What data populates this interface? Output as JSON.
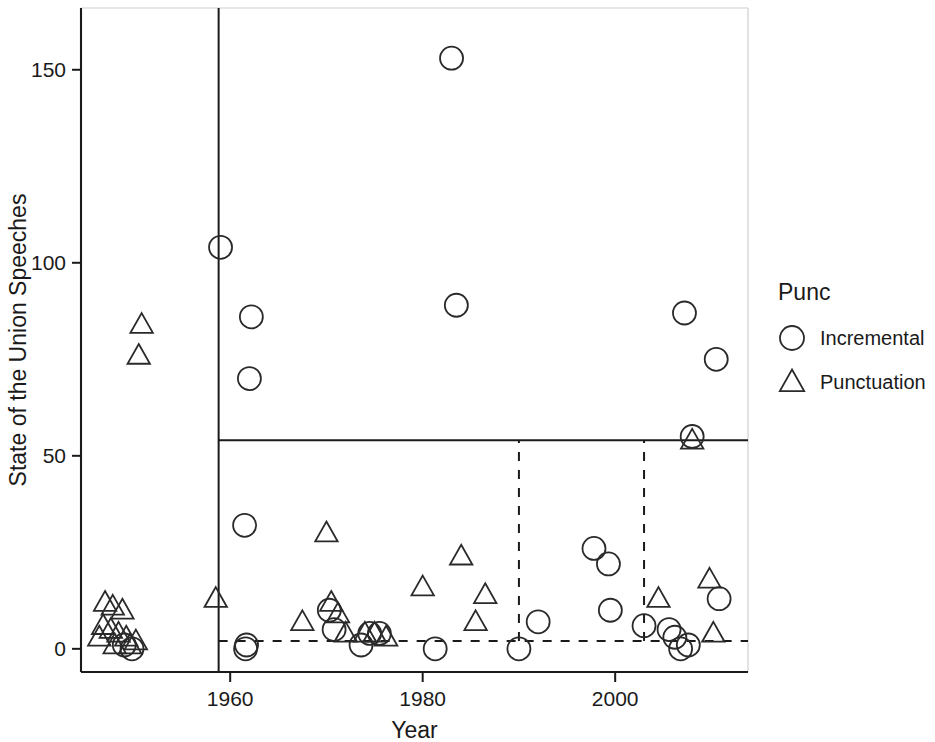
{
  "chart_data": {
    "type": "scatter",
    "title": "",
    "xlabel": "Year",
    "ylabel": "State of the Union Speeches",
    "xlim": [
      1944.5,
      2013.8
    ],
    "ylim": [
      -6,
      166
    ],
    "grid": false,
    "xticks": [
      1960,
      1980,
      2000
    ],
    "xticklabels": [
      "1960",
      "1980",
      "2000"
    ],
    "yticks": [
      0,
      50,
      100,
      150
    ],
    "yticklabels": [
      "0",
      "50",
      "100",
      "150"
    ],
    "legend": {
      "title": "Punc",
      "position": "right",
      "entries": [
        {
          "label": "Incremental",
          "marker": "circle"
        },
        {
          "label": "Punctuation",
          "marker": "triangle"
        }
      ]
    },
    "reference_lines": [
      {
        "name": "vertical-solid-1959",
        "orientation": "vertical",
        "value": 1958.8,
        "style": "solid"
      },
      {
        "name": "horizontal-solid-54",
        "orientation": "horizontal",
        "value": 54,
        "style": "solid",
        "x_from": 1958.8,
        "x_to": 2013.8
      },
      {
        "name": "vertical-dashed-1990",
        "orientation": "vertical",
        "value": 1990,
        "style": "dashed",
        "y_from": 2,
        "y_to": 54
      },
      {
        "name": "vertical-dashed-2003",
        "orientation": "vertical",
        "value": 2003,
        "style": "dashed",
        "y_from": 2,
        "y_to": 54
      },
      {
        "name": "horizontal-dashed-2",
        "orientation": "horizontal",
        "value": 2,
        "style": "dashed",
        "x_from": 1958.8,
        "x_to": 2013.8
      }
    ],
    "series": [
      {
        "name": "Incremental",
        "marker": "circle",
        "points": [
          [
            1959.0,
            104
          ],
          [
            1962.2,
            86
          ],
          [
            1962.0,
            70
          ],
          [
            1961.5,
            32
          ],
          [
            1983.0,
            153
          ],
          [
            1983.5,
            89
          ],
          [
            2007.2,
            87
          ],
          [
            2010.5,
            75
          ],
          [
            2008.0,
            55
          ],
          [
            1997.8,
            26
          ],
          [
            1999.3,
            22
          ],
          [
            1999.5,
            10
          ],
          [
            2003.0,
            6
          ],
          [
            1992.0,
            7
          ],
          [
            2010.8,
            13
          ],
          [
            1970.3,
            10
          ],
          [
            1970.8,
            5
          ],
          [
            1974.5,
            4
          ],
          [
            1975.5,
            4
          ],
          [
            2005.6,
            5
          ],
          [
            2006.2,
            3
          ],
          [
            1961.6,
            0
          ],
          [
            1961.7,
            1
          ],
          [
            1981.3,
            0
          ],
          [
            1990.0,
            0
          ],
          [
            2006.8,
            0
          ],
          [
            2007.6,
            1
          ],
          [
            1973.6,
            1
          ],
          [
            1949.0,
            1
          ],
          [
            1949.8,
            0
          ]
        ]
      },
      {
        "name": "Punctuation",
        "marker": "triangle",
        "points": [
          [
            1950.8,
            84
          ],
          [
            1950.5,
            76
          ],
          [
            1958.5,
            13
          ],
          [
            1970.0,
            30
          ],
          [
            1984.0,
            24
          ],
          [
            1980.0,
            16
          ],
          [
            1986.5,
            14
          ],
          [
            1985.5,
            7
          ],
          [
            2004.5,
            13
          ],
          [
            2009.8,
            18
          ],
          [
            2010.2,
            4
          ],
          [
            2008.0,
            54
          ],
          [
            1967.5,
            7
          ],
          [
            1970.5,
            12
          ],
          [
            1971.2,
            9
          ],
          [
            1972.0,
            4
          ],
          [
            1974.0,
            4
          ],
          [
            1975.0,
            4
          ],
          [
            1976.2,
            3
          ],
          [
            1947.0,
            12
          ],
          [
            1947.8,
            11
          ],
          [
            1948.8,
            10
          ],
          [
            1946.8,
            6
          ],
          [
            1947.6,
            5
          ],
          [
            1948.4,
            4
          ],
          [
            1949.2,
            3
          ],
          [
            1948.0,
            1
          ],
          [
            1949.6,
            1
          ],
          [
            1950.2,
            2
          ],
          [
            1946.4,
            3
          ]
        ]
      }
    ]
  }
}
